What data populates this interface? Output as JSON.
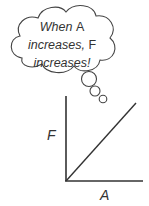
{
  "thought_bubble": {
    "line1": "When",
    "var1": "A",
    "line2": "increases,",
    "var2": "F",
    "line3": "increases!"
  },
  "graph": {
    "y_axis_label": "F",
    "x_axis_label": "A",
    "line_type": "linear increasing through origin"
  },
  "colors": {
    "stroke": "#333333",
    "background": "#ffffff"
  }
}
